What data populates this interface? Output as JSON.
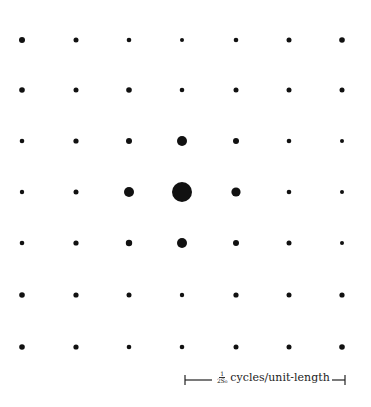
{
  "figure": {
    "type": "lattice-dot-pattern",
    "grid": {
      "columns": 7,
      "rows": 7
    },
    "column_x": [
      22,
      76,
      129,
      182,
      236,
      289,
      342
    ],
    "row_y": [
      40,
      90,
      141,
      192,
      243,
      295,
      347
    ],
    "dot_color": "#111111",
    "radii": [
      [
        3.0,
        2.5,
        2.3,
        2.0,
        2.3,
        2.5,
        2.8
      ],
      [
        2.8,
        2.5,
        2.8,
        2.3,
        2.5,
        2.5,
        2.5
      ],
      [
        2.3,
        2.6,
        3.0,
        5.0,
        3.0,
        2.3,
        2.0
      ],
      [
        2.2,
        2.5,
        5.0,
        10.0,
        4.6,
        2.3,
        2.0
      ],
      [
        2.3,
        2.6,
        3.2,
        5.0,
        3.0,
        2.5,
        2.0
      ],
      [
        2.8,
        2.6,
        2.5,
        2.2,
        2.6,
        2.5,
        2.6
      ],
      [
        2.8,
        2.6,
        2.3,
        2.3,
        2.5,
        2.5,
        2.8
      ]
    ]
  },
  "scale_bar": {
    "x_start": 185,
    "x_end": 345,
    "y": 380,
    "fraction_numerator": "1",
    "fraction_denominator": "2S₀",
    "unit_label": "cycles/unit-length"
  }
}
